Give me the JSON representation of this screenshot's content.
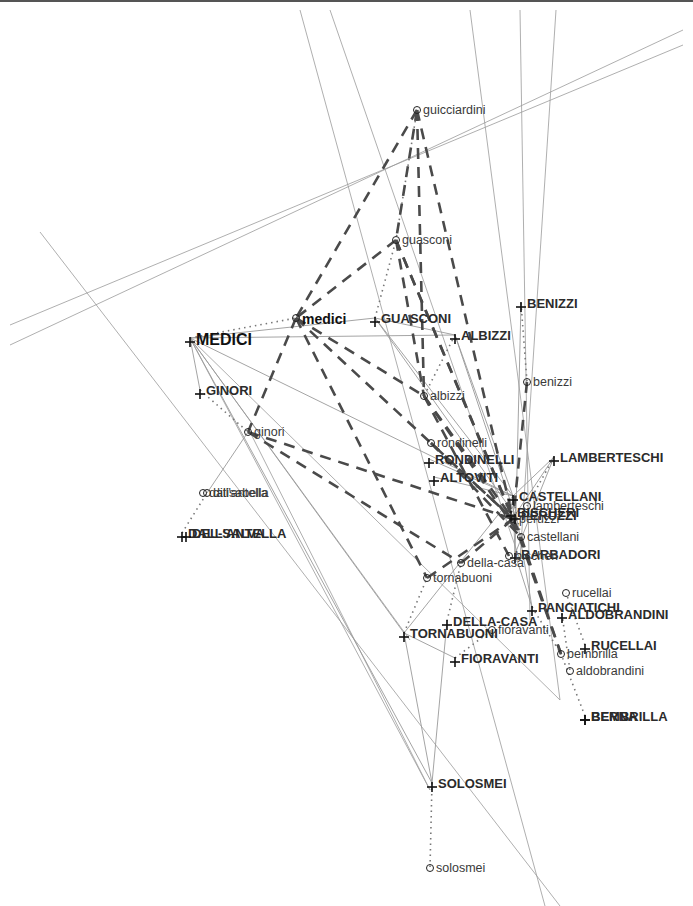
{
  "figure": {
    "width": 693,
    "height": 906,
    "background_color": "#ffffff",
    "rule_color": "#555555"
  },
  "legend": {
    "uppercase_marker": "plus-marker",
    "lowercase_marker": "circle-marker",
    "edge_styles": [
      "solid-thin",
      "dashed-thick",
      "dotted-thin"
    ]
  },
  "chart_data": {
    "type": "scatter",
    "xlabel": "",
    "ylabel": "",
    "grid": false,
    "legend_position": "none",
    "node_colors": {
      "uppercase": "#2b2b2b",
      "lowercase": "#3a3a3a"
    },
    "edge_colors": {
      "solid": "#9a9a9a",
      "dashed": "#4a4a4a",
      "dotted": "#777777"
    },
    "nodes": [
      {
        "id": "MEDICI",
        "label": "MEDICI",
        "case": "upper",
        "marker": "plus-marker",
        "x": 190,
        "y": 338,
        "size": "big"
      },
      {
        "id": "medici",
        "label": "medici",
        "case": "lower",
        "marker": "circle-marker",
        "x": 296,
        "y": 318,
        "size": "medium"
      },
      {
        "id": "GINORI",
        "label": "GINORI",
        "case": "upper",
        "marker": "plus-marker",
        "x": 200,
        "y": 390,
        "size": "normal"
      },
      {
        "id": "ginori",
        "label": "ginori",
        "case": "lower",
        "marker": "circle-marker",
        "x": 248,
        "y": 432,
        "size": "normal"
      },
      {
        "id": "GUASCONI",
        "label": "GUASCONI",
        "case": "upper",
        "marker": "plus-marker",
        "x": 375,
        "y": 318,
        "size": "normal"
      },
      {
        "id": "guasconi",
        "label": "guasconi",
        "case": "lower",
        "marker": "circle-marker",
        "x": 396,
        "y": 240,
        "size": "normal"
      },
      {
        "id": "guicciardini",
        "label": "guicciardini",
        "case": "lower",
        "marker": "circle-marker",
        "x": 417,
        "y": 110,
        "size": "normal"
      },
      {
        "id": "ALBIZZI",
        "label": "ALBIZZI",
        "case": "upper",
        "marker": "plus-marker",
        "x": 455,
        "y": 335,
        "size": "normal"
      },
      {
        "id": "albizzi",
        "label": "albizzi",
        "case": "lower",
        "marker": "circle-marker",
        "x": 424,
        "y": 396,
        "size": "normal"
      },
      {
        "id": "BENIZZI",
        "label": "BENIZZI",
        "case": "upper",
        "marker": "plus-marker",
        "x": 521,
        "y": 303,
        "size": "normal"
      },
      {
        "id": "benizzi",
        "label": "benizzi",
        "case": "lower",
        "marker": "circle-marker",
        "x": 527,
        "y": 382,
        "size": "normal"
      },
      {
        "id": "RONDINELLI",
        "label": "RONDINELLI",
        "case": "upper",
        "marker": "plus-marker",
        "x": 429,
        "y": 459,
        "size": "normal"
      },
      {
        "id": "rondinelli",
        "label": "rondinelli",
        "case": "lower",
        "marker": "circle-marker",
        "x": 431,
        "y": 443,
        "size": "normal"
      },
      {
        "id": "ALTOVITI",
        "label": "ALTOVITI",
        "case": "upper",
        "marker": "plus-marker",
        "x": 434,
        "y": 477,
        "size": "normal"
      },
      {
        "id": "LAMBERTESCHI",
        "label": "LAMBERTESCHI",
        "case": "upper",
        "marker": "plus-marker",
        "x": 554,
        "y": 457,
        "size": "normal"
      },
      {
        "id": "lamberteschi",
        "label": "lamberteschi",
        "case": "lower",
        "marker": "circle-marker",
        "x": 527,
        "y": 506,
        "size": "normal"
      },
      {
        "id": "CASTELLANI",
        "label": "CASTELLANI",
        "case": "upper",
        "marker": "plus-marker",
        "x": 513,
        "y": 496,
        "size": "normal"
      },
      {
        "id": "castellani",
        "label": "castellani",
        "case": "lower",
        "marker": "circle-marker",
        "x": 521,
        "y": 537,
        "size": "normal"
      },
      {
        "id": "PERUZZI",
        "label": "PERUZZI",
        "case": "upper",
        "marker": "plus-marker",
        "x": 515,
        "y": 515,
        "size": "normal"
      },
      {
        "id": "BISCHERI",
        "label": "BISCHERI",
        "case": "upper",
        "marker": "plus-marker",
        "x": 511,
        "y": 512,
        "size": "normal"
      },
      {
        "id": "BARBADORI",
        "label": "BARBADORI",
        "case": "upper",
        "marker": "plus-marker",
        "x": 515,
        "y": 554,
        "size": "normal"
      },
      {
        "id": "bischeri",
        "label": "bischeri",
        "case": "lower",
        "marker": "circle-marker",
        "x": 509,
        "y": 556,
        "size": "normal"
      },
      {
        "id": "peruzzi",
        "label": "peruzzi",
        "case": "lower",
        "marker": "circle-marker",
        "x": 513,
        "y": 519,
        "size": "normal"
      },
      {
        "id": "della-casa",
        "label": "della-casa",
        "case": "lower",
        "marker": "circle-marker",
        "x": 461,
        "y": 563,
        "size": "normal"
      },
      {
        "id": "DELLA-CASA",
        "label": "DELLA-CASA",
        "case": "upper",
        "marker": "plus-marker",
        "x": 447,
        "y": 621,
        "size": "normal"
      },
      {
        "id": "tornabuoni",
        "label": "tornabuoni",
        "case": "lower",
        "marker": "circle-marker",
        "x": 427,
        "y": 578,
        "size": "normal"
      },
      {
        "id": "TORNABUONI",
        "label": "TORNABUONI",
        "case": "upper",
        "marker": "plus-marker",
        "x": 404,
        "y": 633,
        "size": "normal"
      },
      {
        "id": "fioravanti",
        "label": "fioravanti",
        "case": "lower",
        "marker": "circle-marker",
        "x": 492,
        "y": 630,
        "size": "normal"
      },
      {
        "id": "FIORAVANTI",
        "label": "FIORAVANTI",
        "case": "upper",
        "marker": "plus-marker",
        "x": 455,
        "y": 658,
        "size": "normal"
      },
      {
        "id": "rucellai",
        "label": "rucellai",
        "case": "lower",
        "marker": "circle-marker",
        "x": 566,
        "y": 593,
        "size": "normal"
      },
      {
        "id": "PANCIATICHI",
        "label": "PANCIATICHI",
        "case": "upper",
        "marker": "plus-marker",
        "x": 532,
        "y": 607,
        "size": "normal"
      },
      {
        "id": "ALDOBRANDINI",
        "label": "ALDOBRANDINI",
        "case": "upper",
        "marker": "plus-marker",
        "x": 562,
        "y": 614,
        "size": "normal"
      },
      {
        "id": "RUCELLAI",
        "label": "RUCELLAI",
        "case": "upper",
        "marker": "plus-marker",
        "x": 585,
        "y": 645,
        "size": "normal"
      },
      {
        "id": "bembrilla",
        "label": "bembrilla",
        "case": "lower",
        "marker": "circle-marker",
        "x": 561,
        "y": 654,
        "size": "normal"
      },
      {
        "id": "aldobrandini",
        "label": "aldobrandini",
        "case": "lower",
        "marker": "circle-marker",
        "x": 570,
        "y": 671,
        "size": "normal"
      },
      {
        "id": "BEMBRILLA",
        "label": "BEMBRILLA",
        "case": "upper",
        "marker": "plus-marker",
        "x": 585,
        "y": 716,
        "size": "normal"
      },
      {
        "id": "BERNA",
        "label": "BERNA",
        "case": "upper",
        "marker": "plus-marker",
        "x": 585,
        "y": 716,
        "size": "normal"
      },
      {
        "id": "dallantella",
        "label": "dall'antella",
        "case": "lower",
        "marker": "circle-marker",
        "x": 203,
        "y": 493,
        "size": "normal"
      },
      {
        "id": "ditisalbella",
        "label": "ditisabella",
        "case": "lower",
        "marker": "circle-marker",
        "x": 207,
        "y": 493,
        "size": "normal"
      },
      {
        "id": "DALLANTELLA",
        "label": "DALL'ANTELLA",
        "case": "upper",
        "marker": "plus-marker",
        "x": 182,
        "y": 533,
        "size": "normal"
      },
      {
        "id": "DELSALVA",
        "label": "DEL-SALVA",
        "case": "upper",
        "marker": "plus-marker",
        "x": 186,
        "y": 533,
        "size": "normal"
      },
      {
        "id": "SOLOSMEI",
        "label": "SOLOSMEI",
        "case": "upper",
        "marker": "plus-marker",
        "x": 432,
        "y": 783,
        "size": "normal"
      },
      {
        "id": "solosmei",
        "label": "solosmei",
        "case": "lower",
        "marker": "circle-marker",
        "x": 430,
        "y": 868,
        "size": "normal"
      }
    ],
    "dotted_pairs": [
      [
        "MEDICI",
        "medici"
      ],
      [
        "GINORI",
        "ginori"
      ],
      [
        "GUASCONI",
        "guasconi"
      ],
      [
        "ALBIZZI",
        "albizzi"
      ],
      [
        "BENIZZI",
        "benizzi"
      ],
      [
        "SOLOSMEI",
        "solosmei"
      ],
      [
        "DALLANTELLA",
        "ditisalbella"
      ],
      [
        "RUCELLAI",
        "rucellai"
      ],
      [
        "ALDOBRANDINI",
        "aldobrandini"
      ],
      [
        "BEMBRILLA",
        "bembrilla"
      ],
      [
        "DELLA-CASA",
        "della-casa"
      ],
      [
        "TORNABUONI",
        "tornabuoni"
      ],
      [
        "FIORAVANTI",
        "fioravanti"
      ],
      [
        "LAMBERTESCHI",
        "lamberteschi"
      ],
      [
        "CASTELLANI",
        "castellani"
      ],
      [
        "PANCIATICHI",
        "bembrilla"
      ],
      [
        "guicciardini",
        "guasconi"
      ]
    ],
    "dashed_edges": [
      [
        "guicciardini",
        "medici"
      ],
      [
        "guicciardini",
        "guasconi"
      ],
      [
        "guicciardini",
        "albizzi"
      ],
      [
        "guicciardini",
        "peruzzi"
      ],
      [
        "guasconi",
        "medici"
      ],
      [
        "guasconi",
        "albizzi"
      ],
      [
        "guasconi",
        "peruzzi"
      ],
      [
        "guasconi",
        "castellani"
      ],
      [
        "medici",
        "albizzi"
      ],
      [
        "medici",
        "peruzzi"
      ],
      [
        "medici",
        "tornabuoni"
      ],
      [
        "medici",
        "ginori"
      ],
      [
        "albizzi",
        "peruzzi"
      ],
      [
        "albizzi",
        "castellani"
      ],
      [
        "albizzi",
        "bischeri"
      ],
      [
        "ginori",
        "peruzzi"
      ],
      [
        "ginori",
        "della-casa"
      ],
      [
        "rondinelli",
        "peruzzi"
      ],
      [
        "rondinelli",
        "castellani"
      ],
      [
        "tornabuoni",
        "peruzzi"
      ],
      [
        "della-casa",
        "peruzzi"
      ],
      [
        "benizzi",
        "peruzzi"
      ],
      [
        "peruzzi",
        "bembrilla"
      ],
      [
        "castellani",
        "bembrilla"
      ]
    ],
    "solid_edges": [
      [
        "MEDICI",
        "GINORI"
      ],
      [
        "MEDICI",
        "GUASCONI"
      ],
      [
        "MEDICI",
        "ALBIZZI"
      ],
      [
        "MEDICI",
        "CASTELLANI"
      ],
      [
        "MEDICI",
        "TORNABUONI"
      ],
      [
        "MEDICI",
        "SOLOSMEI"
      ],
      [
        "GUASCONI",
        "ALBIZZI"
      ],
      [
        "GUASCONI",
        "CASTELLANI"
      ],
      [
        "GUASCONI",
        "PERUZZI"
      ],
      [
        "ALBIZZI",
        "CASTELLANI"
      ],
      [
        "ALBIZZI",
        "PERUZZI"
      ],
      [
        "RONDINELLI",
        "CASTELLANI"
      ],
      [
        "ALTOVITI",
        "CASTELLANI"
      ],
      [
        "LAMBERTESCHI",
        "CASTELLANI"
      ],
      [
        "LAMBERTESCHI",
        "PERUZZI"
      ],
      [
        "LAMBERTESCHI",
        "BARBADORI"
      ],
      [
        "CASTELLANI",
        "BARBADORI"
      ],
      [
        "CASTELLANI",
        "PANCIATICHI"
      ],
      [
        "CASTELLANI",
        "TORNABUONI"
      ],
      [
        "BARBADORI",
        "PANCIATICHI"
      ],
      [
        "TORNABUONI",
        "FIORAVANTI"
      ],
      [
        "TORNABUONI",
        "SOLOSMEI"
      ],
      [
        "DELLA-CASA",
        "SOLOSMEI"
      ],
      [
        "BENIZZI",
        "BARBADORI"
      ],
      [
        "ginori",
        "ditisalbella"
      ]
    ]
  }
}
